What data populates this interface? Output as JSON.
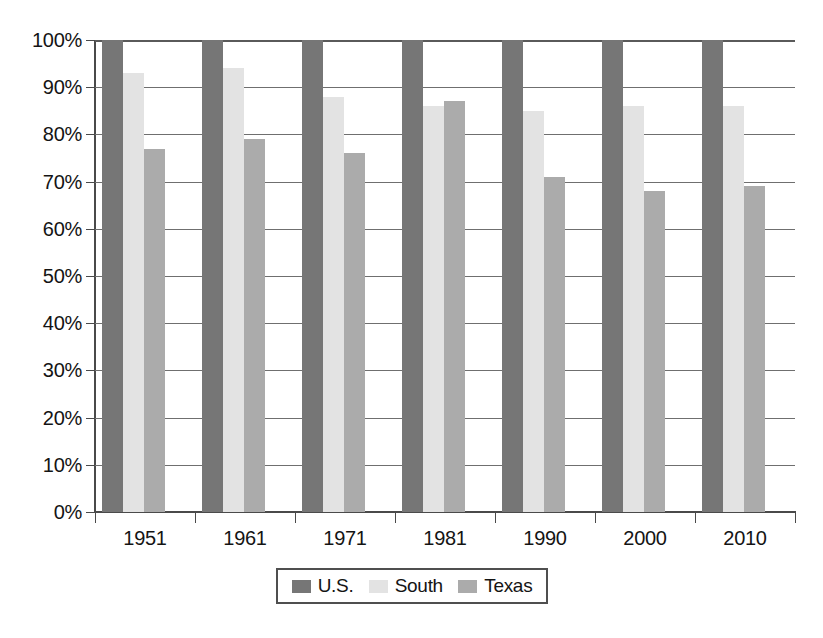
{
  "chart_data": {
    "type": "bar",
    "title": "",
    "subtitle": "",
    "xlabel": "",
    "ylabel": "",
    "categories": [
      "1951",
      "1961",
      "1971",
      "1981",
      "1990",
      "2000",
      "2010"
    ],
    "series": [
      {
        "name": "U.S.",
        "color": "#767676",
        "values": [
          100,
          100,
          100,
          100,
          100,
          100,
          100
        ]
      },
      {
        "name": "South",
        "color": "#e3e3e3",
        "values": [
          93,
          94,
          88,
          86,
          85,
          86,
          86
        ]
      },
      {
        "name": "Texas",
        "color": "#ababab",
        "values": [
          77,
          79,
          76,
          87,
          71,
          68,
          69
        ]
      }
    ],
    "ylim": [
      0,
      100
    ],
    "ytick_values": [
      0,
      10,
      20,
      30,
      40,
      50,
      60,
      70,
      80,
      90,
      100
    ],
    "ytick_labels": [
      "0%",
      "10%",
      "20%",
      "30%",
      "40%",
      "50%",
      "60%",
      "70%",
      "80%",
      "90%",
      "100%"
    ],
    "grid": "horizontal",
    "legend_position": "bottom",
    "value_suffix": "%"
  },
  "legend": {
    "entries": [
      {
        "label": "U.S."
      },
      {
        "label": "South"
      },
      {
        "label": "Texas"
      }
    ]
  }
}
